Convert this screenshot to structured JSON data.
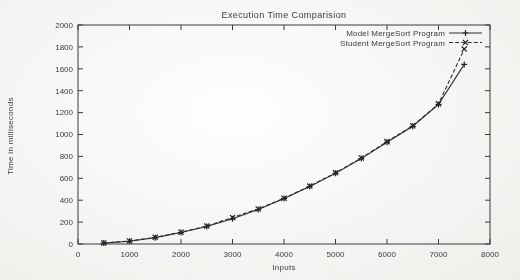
{
  "chart_data": {
    "type": "line",
    "title": "Execution Time Comparision",
    "xlabel": "Inputs",
    "ylabel": "Time in milliseconds",
    "xlim": [
      0,
      8000
    ],
    "ylim": [
      0,
      2000
    ],
    "xticks": [
      0,
      1000,
      2000,
      3000,
      4000,
      5000,
      6000,
      7000,
      8000
    ],
    "yticks": [
      0,
      200,
      400,
      600,
      800,
      1000,
      1200,
      1400,
      1600,
      1800,
      2000
    ],
    "grid": false,
    "legend_position": "top-right-inside",
    "x": [
      500,
      1000,
      1500,
      2000,
      2500,
      3000,
      3500,
      4000,
      4500,
      5000,
      5500,
      6000,
      6500,
      7000,
      7500
    ],
    "series": [
      {
        "name": "Model MergeSort Program",
        "linestyle": "solid",
        "marker": "plus",
        "values": [
          8,
          25,
          58,
          105,
          160,
          230,
          315,
          415,
          525,
          645,
          780,
          930,
          1075,
          1275,
          1640
        ]
      },
      {
        "name": "Student MergeSort Program",
        "linestyle": "dashed",
        "marker": "cross",
        "values": [
          10,
          28,
          61,
          108,
          164,
          242,
          320,
          418,
          529,
          650,
          785,
          935,
          1080,
          1280,
          1780
        ]
      }
    ]
  }
}
